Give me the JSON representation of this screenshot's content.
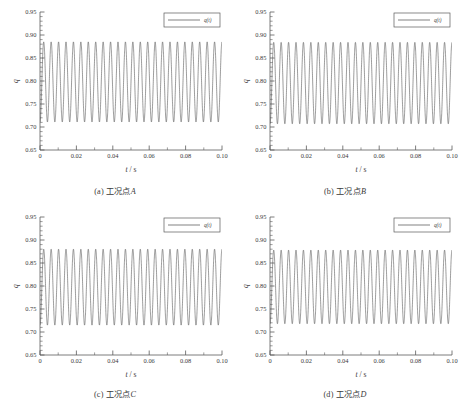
{
  "figure": {
    "panel_count": 4,
    "line_color": "#4a4a4a",
    "axis_color": "#5a5a5a",
    "text_color": "#3a3a3a"
  },
  "axes": {
    "xlabel_sym": "t",
    "xlabel_unit": "/ s",
    "ylabel": "q",
    "xticks": [
      "0",
      "0.02",
      "0.04",
      "0.06",
      "0.08",
      "0.10"
    ],
    "xtick_values": [
      0,
      0.02,
      0.04,
      0.06,
      0.08,
      0.1
    ],
    "yticks": [
      "0.65",
      "0.70",
      "0.75",
      "0.80",
      "0.85",
      "0.90",
      "0.95"
    ],
    "ytick_values": [
      0.65,
      0.7,
      0.75,
      0.8,
      0.85,
      0.9,
      0.95
    ],
    "xlim": [
      0,
      0.1
    ],
    "ylim": [
      0.65,
      0.95
    ],
    "minor_ticks_per_major_x": 2,
    "minor_ticks_per_major_y": 5,
    "grid": "off",
    "spines": "left-bottom"
  },
  "legend": {
    "label": "q(t)",
    "position": "top-right",
    "box": true
  },
  "chart_data": [
    {
      "type": "line",
      "panel": "a",
      "caption_prefix": "(a)",
      "caption_text": "工况点",
      "caption_point": "A",
      "series_name": "q(t)",
      "xlabel": "t / s",
      "ylabel": "q",
      "xlim": [
        0,
        0.1
      ],
      "ylim": [
        0.65,
        0.95
      ],
      "waveform": {
        "mean": 0.798,
        "amplitude": 0.087,
        "frequency_hz": 245,
        "phase_rad": -1.5708,
        "cycles_over_span": 24.5,
        "min": 0.711,
        "max": 0.885
      }
    },
    {
      "type": "line",
      "panel": "b",
      "caption_prefix": "(b)",
      "caption_text": "工况点",
      "caption_point": "B",
      "series_name": "q(t)",
      "xlabel": "t / s",
      "ylabel": "q",
      "xlim": [
        0,
        0.1
      ],
      "ylim": [
        0.65,
        0.95
      ],
      "waveform": {
        "mean": 0.7955,
        "amplitude": 0.0885,
        "frequency_hz": 245,
        "phase_rad": -1.5708,
        "cycles_over_span": 24.5,
        "min": 0.707,
        "max": 0.884
      }
    },
    {
      "type": "line",
      "panel": "c",
      "caption_prefix": "(c)",
      "caption_text": "工况点",
      "caption_point": "C",
      "series_name": "q(t)",
      "xlabel": "t / s",
      "ylabel": "q",
      "xlim": [
        0,
        0.1
      ],
      "ylim": [
        0.65,
        0.95
      ],
      "waveform": {
        "mean": 0.7975,
        "amplitude": 0.0825,
        "frequency_hz": 245,
        "phase_rad": -1.5708,
        "cycles_over_span": 24.5,
        "min": 0.715,
        "max": 0.88
      }
    },
    {
      "type": "line",
      "panel": "d",
      "caption_prefix": "(d)",
      "caption_text": "工况点",
      "caption_point": "D",
      "series_name": "q(t)",
      "xlabel": "t / s",
      "ylabel": "q",
      "xlim": [
        0,
        0.1
      ],
      "ylim": [
        0.65,
        0.95
      ],
      "waveform": {
        "mean": 0.798,
        "amplitude": 0.08,
        "frequency_hz": 245,
        "phase_rad": -1.5708,
        "cycles_over_span": 24.5,
        "min": 0.718,
        "max": 0.878
      }
    }
  ]
}
